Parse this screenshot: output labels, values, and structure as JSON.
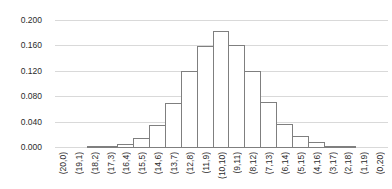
{
  "chart_data": {
    "type": "bar",
    "subtype": "histogram",
    "title": "",
    "xlabel": "",
    "ylabel": "",
    "categories": [
      "(20,0)",
      "(19,1)",
      "(18,2)",
      "(17,3)",
      "(16,4)",
      "(15,5)",
      "(14,6)",
      "(13,7)",
      "(12,8)",
      "(11,9)",
      "(10,10)",
      "(9,11)",
      "(8,12)",
      "(7,13)",
      "(6,14)",
      "(5,15)",
      "(4,16)",
      "(3,17)",
      "(2,18)",
      "(1,19)",
      "(0,20)"
    ],
    "values": [
      0,
      0,
      0.0005,
      0.002,
      0.007,
      0.015,
      0.036,
      0.071,
      0.12,
      0.16,
      0.183,
      0.161,
      0.121,
      0.072,
      0.038,
      0.019,
      0.009,
      0.0035,
      0.001,
      0,
      0
    ],
    "ylim": [
      0,
      0.2
    ],
    "ytick_interval": 0.04,
    "ytick_labels": [
      "0.000",
      "0.040",
      "0.080",
      "0.120",
      "0.160",
      "0.200"
    ],
    "grid": true,
    "legend": false,
    "colors": {
      "background": "#ffffff",
      "bar_fill": "#ffffff",
      "bar_border": "#7f7f7f",
      "gridline": "#d9d9d9",
      "axis_text": "#2b2b2b"
    }
  }
}
